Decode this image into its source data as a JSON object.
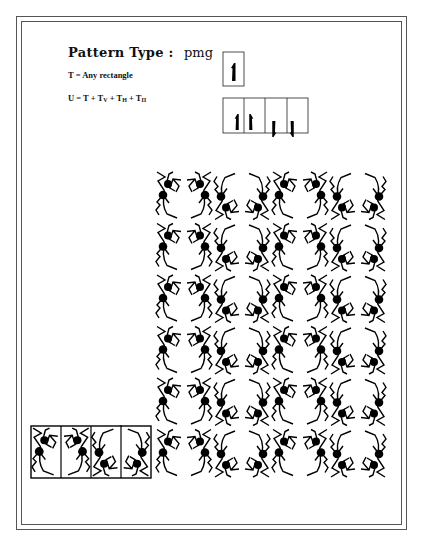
{
  "header": {
    "title_label": "Pattern Type :",
    "pattern_type": "pmg"
  },
  "definitions": {
    "t_label": "T = Any rectangle",
    "u_prefix": "U = T + T",
    "u_sub_v": "V",
    "u_plus1": " + T",
    "u_sub_h": "H",
    "u_plus2": " + T",
    "u_sub_pi": "Π"
  },
  "legend": {
    "single_tile_glyph": "1",
    "unit_cell_count": 4
  },
  "pattern": {
    "columns": 8,
    "rows": 6,
    "ink_color": "#000000",
    "paper_color": "#ffffff"
  }
}
